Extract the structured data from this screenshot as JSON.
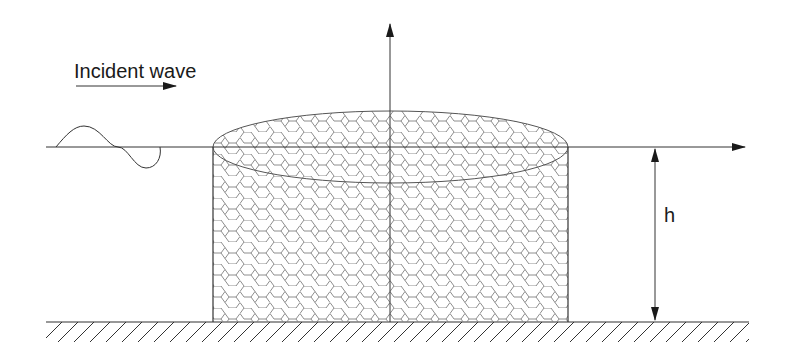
{
  "diagram": {
    "incident_label": "Incident wave",
    "depth_label": "h",
    "colors": {
      "line": "#2a2a2a",
      "mesh": "#7a7a7a",
      "background": "#ffffff"
    },
    "geometry": {
      "water_surface_y": 147,
      "seabed_y": 322,
      "cylinder_left_x": 213,
      "cylinder_right_x": 568,
      "axis_x": 390,
      "ellipse_cy": 147,
      "ellipse_ry": 36,
      "depth_arrow_x": 655
    }
  }
}
